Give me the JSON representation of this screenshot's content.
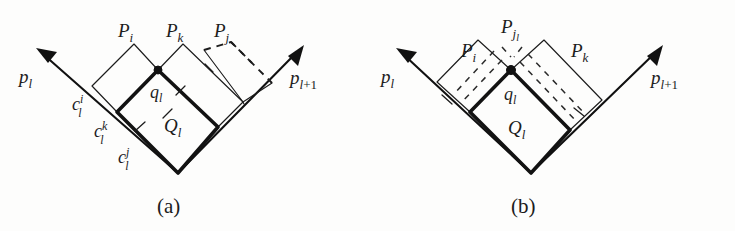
{
  "figure": {
    "background_color": "#fdfdfc",
    "ink_color": "#1c1c1c",
    "panels": [
      {
        "id": "a",
        "caption": "(a)",
        "vectors": [
          {
            "name": "p_l",
            "base": "p",
            "sub": "l",
            "direction": "up-left"
          },
          {
            "name": "p_l+1",
            "base": "p",
            "sub": "l+1",
            "direction": "up-right"
          }
        ],
        "region_labels": [
          {
            "name": "P_i",
            "base": "P",
            "sub": "i"
          },
          {
            "name": "P_k",
            "base": "P",
            "sub": "k"
          },
          {
            "name": "P_j",
            "base": "P",
            "sub": "j"
          }
        ],
        "cut_labels": [
          {
            "name": "c_l^i",
            "base": "c",
            "sub": "l",
            "sup": "i"
          },
          {
            "name": "c_l^k",
            "base": "c",
            "sub": "l",
            "sup": "k"
          },
          {
            "name": "c_l^j",
            "base": "c",
            "sub": "l",
            "sup": "j"
          }
        ],
        "vertex_label": {
          "name": "q_l",
          "base": "q",
          "sub": "l"
        },
        "cell_label": {
          "name": "Q_l",
          "base": "Q",
          "sub": "l"
        },
        "styles": {
          "Q_l": "bold-solid",
          "P_i": "thin-solid",
          "P_k": "thin-solid",
          "P_j": "dashed"
        }
      },
      {
        "id": "b",
        "caption": "(b)",
        "vectors": [
          {
            "name": "p_l",
            "base": "p",
            "sub": "l",
            "direction": "up-left"
          },
          {
            "name": "p_l+1",
            "base": "p",
            "sub": "l+1",
            "direction": "up-right"
          }
        ],
        "region_labels": [
          {
            "name": "P_i",
            "base": "P",
            "sub": "i"
          },
          {
            "name": "P_jl",
            "base": "P",
            "sub": "j",
            "subsub": "l"
          },
          {
            "name": "P_k",
            "base": "P",
            "sub": "k"
          }
        ],
        "cut_labels": [],
        "vertex_label": {
          "name": "q_l",
          "base": "q",
          "sub": "l"
        },
        "cell_label": {
          "name": "Q_l",
          "base": "Q",
          "sub": "l"
        },
        "styles": {
          "Q_l": "bold-solid",
          "P_i": "thin-solid",
          "P_k": "thin-solid",
          "P_jl": "dashed-overlay"
        }
      }
    ]
  }
}
